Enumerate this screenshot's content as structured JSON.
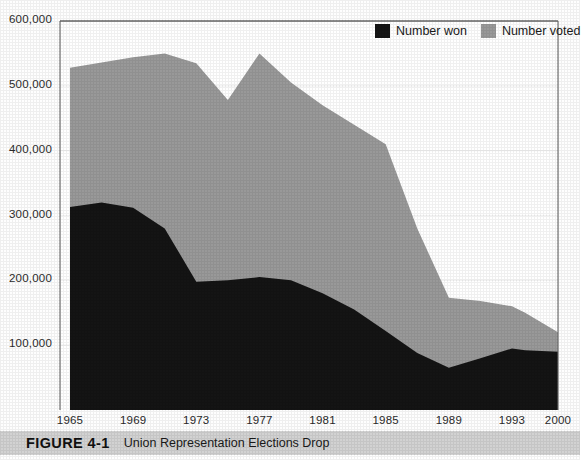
{
  "figure": {
    "number": "FIGURE 4-1",
    "title": "Union Representation Elections Drop"
  },
  "legend": {
    "position": "top-right",
    "entries": [
      {
        "label": "Number won",
        "color": "#141414",
        "icon": "legend-swatch-black"
      },
      {
        "label": "Number voted",
        "color": "#999999",
        "icon": "legend-swatch-gray"
      }
    ]
  },
  "colors": {
    "number_won": "#141414",
    "number_voted": "#999999",
    "gridline": "#f2f2f2",
    "axis": "#555555",
    "caption_bar": "#d2d2d2",
    "plot_background": "#ffffff"
  },
  "chart_data": {
    "type": "area",
    "stacked": false,
    "title": "Union Representation Elections Drop",
    "xlabel": "",
    "ylabel": "",
    "xlim": [
      1965,
      2000
    ],
    "ylim": [
      0,
      600000
    ],
    "grid": true,
    "yticks": [
      100000,
      200000,
      300000,
      400000,
      500000,
      600000
    ],
    "ytick_labels": [
      "100,000",
      "200,000",
      "300,000",
      "400,000",
      "500,000",
      "600,000"
    ],
    "xticks": [
      1965,
      1969,
      1973,
      1977,
      1981,
      1985,
      1989,
      1993,
      2000
    ],
    "xtick_labels": [
      "1965",
      "1969",
      "1973",
      "1977",
      "1981",
      "1985",
      "1989",
      "1993",
      "2000"
    ],
    "x": [
      1965,
      1967,
      1969,
      1971,
      1973,
      1975,
      1977,
      1979,
      1981,
      1983,
      1985,
      1987,
      1989,
      1991,
      1993,
      1995,
      2000
    ],
    "series": [
      {
        "name": "Number voted",
        "color": "#999999",
        "values": [
          528000,
          536000,
          544000,
          550000,
          535000,
          478000,
          550000,
          505000,
          470000,
          440000,
          410000,
          280000,
          173000,
          168000,
          160000,
          150000,
          120000
        ]
      },
      {
        "name": "Number won",
        "color": "#141414",
        "values": [
          313000,
          320000,
          312000,
          280000,
          198000,
          200000,
          205000,
          200000,
          180000,
          155000,
          122000,
          88000,
          65000,
          80000,
          95000,
          92000,
          90000
        ]
      }
    ]
  }
}
